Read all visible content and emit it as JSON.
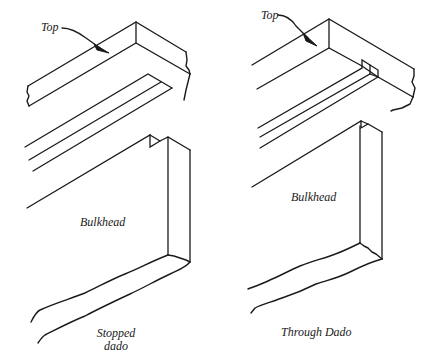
{
  "figure": {
    "left_panel": {
      "top_label": "Top",
      "bulkhead_label": "Bulkhead",
      "caption_line1": "Stopped",
      "caption_line2": "dado"
    },
    "right_panel": {
      "top_label": "Top",
      "bulkhead_label": "Bulkhead",
      "caption": "Through Dado"
    },
    "colors": {
      "ink": "#1a1a1a",
      "background": "#ffffff"
    }
  }
}
